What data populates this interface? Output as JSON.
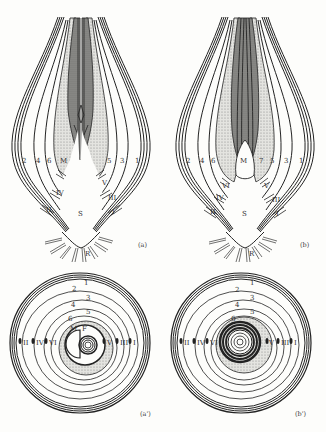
{
  "figures": [
    {
      "id": "a",
      "caption": "(a)",
      "type": "longitudinal-section",
      "leaf_numbers": [
        "1",
        "2",
        "3",
        "4",
        "5",
        "6"
      ],
      "left_labels": [
        "2",
        "4",
        "6",
        "M"
      ],
      "right_labels": [
        "5",
        "3",
        "1"
      ],
      "bud_labels": [
        "IV",
        "II",
        "V",
        "III",
        "I"
      ],
      "center_labels": {
        "scale": "S",
        "roots": "R"
      }
    },
    {
      "id": "b",
      "caption": "(b)",
      "type": "longitudinal-section",
      "left_labels": [
        "2",
        "4",
        "6",
        "M"
      ],
      "right_labels": [
        "7",
        "5",
        "3",
        "1"
      ],
      "bud_labels": [
        "VI",
        "IV",
        "II",
        "V",
        "III",
        "I"
      ],
      "center_labels": {
        "scale": "S",
        "roots": "R"
      }
    },
    {
      "id": "a_prime",
      "caption": "(a')",
      "type": "cross-section",
      "ring_labels": [
        "1",
        "2",
        "3",
        "4",
        "5",
        "6"
      ],
      "bud_labels_left": [
        "II",
        "IV",
        "VI"
      ],
      "bud_labels_right": [
        "V",
        "III",
        "I"
      ],
      "center_labels": [
        "M",
        "F"
      ]
    },
    {
      "id": "b_prime",
      "caption": "(b')",
      "type": "cross-section",
      "ring_labels": [
        "1",
        "2",
        "3",
        "4",
        "5",
        "6"
      ],
      "bud_labels_left": [
        "II",
        "IV",
        "VI"
      ],
      "bud_labels_right": [
        "V",
        "III",
        "I"
      ]
    }
  ],
  "colors": {
    "line": "#222222",
    "shade_light": "#d6d6d2",
    "shade_dark": "#8a8a86",
    "background": "#fdfdfb"
  }
}
